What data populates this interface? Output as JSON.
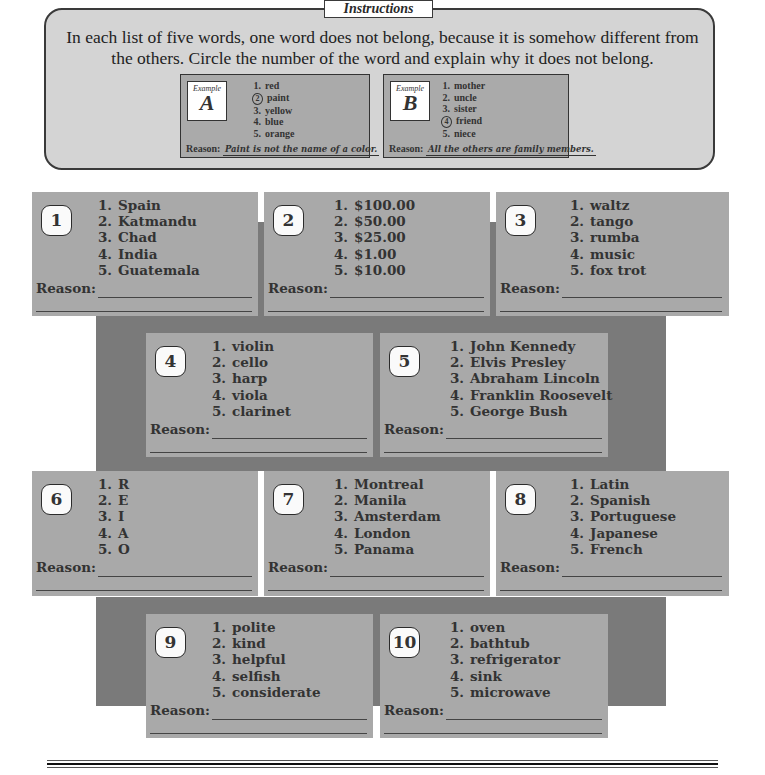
{
  "instructions": {
    "tab_label": "Instructions",
    "text": "In each list of five words, one word does not belong, because it is somehow different from the others. Circle the number of the word and explain why it does not belong."
  },
  "examples": [
    {
      "label": "Example",
      "letter": "A",
      "items": [
        "red",
        "paint",
        "yellow",
        "blue",
        "orange"
      ],
      "circled_index": 2,
      "reason_label": "Reason:",
      "reason": "Paint is not the name of a color."
    },
    {
      "label": "Example",
      "letter": "B",
      "items": [
        "mother",
        "uncle",
        "sister",
        "friend",
        "niece"
      ],
      "circled_index": 4,
      "reason_label": "Reason:",
      "reason": "All the others are family members."
    }
  ],
  "reason_label": "Reason:",
  "cards": [
    {
      "number": "1",
      "items": [
        "Spain",
        "Katmandu",
        "Chad",
        "India",
        "Guatemala"
      ]
    },
    {
      "number": "2",
      "items": [
        "$100.00",
        "$50.00",
        "$25.00",
        "$1.00",
        "$10.00"
      ]
    },
    {
      "number": "3",
      "items": [
        "waltz",
        "tango",
        "rumba",
        "music",
        "fox trot"
      ]
    },
    {
      "number": "4",
      "items": [
        "violin",
        "cello",
        "harp",
        "viola",
        "clarinet"
      ]
    },
    {
      "number": "5",
      "items": [
        "John Kennedy",
        "Elvis Presley",
        "Abraham Lincoln",
        "Franklin Roosevelt",
        "George Bush"
      ]
    },
    {
      "number": "6",
      "items": [
        "R",
        "E",
        "I",
        "A",
        "O"
      ]
    },
    {
      "number": "7",
      "items": [
        "Montreal",
        "Manila",
        "Amsterdam",
        "London",
        "Panama"
      ]
    },
    {
      "number": "8",
      "items": [
        "Latin",
        "Spanish",
        "Portuguese",
        "Japanese",
        "French"
      ]
    },
    {
      "number": "9",
      "items": [
        "polite",
        "kind",
        "helpful",
        "selfish",
        "considerate"
      ]
    },
    {
      "number": "10",
      "items": [
        "oven",
        "bathtub",
        "refrigerator",
        "sink",
        "microwave"
      ]
    }
  ],
  "colors": {
    "panel": "#d4d4d4",
    "card": "#a9a9a9",
    "band": "#7a7a7a",
    "badge": "#fafafa",
    "ink": "#2a2a2a"
  }
}
